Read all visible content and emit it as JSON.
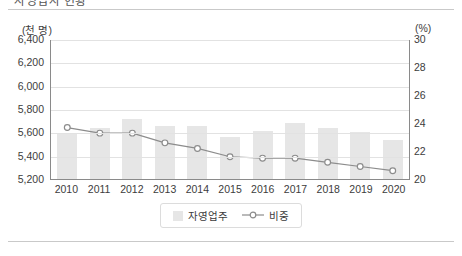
{
  "document": {
    "title_partial": "자영업자 현황",
    "has_top_rule": true,
    "has_bottom_rule": true
  },
  "chart_data": {
    "type": "bar",
    "title": "",
    "subtitle": "",
    "categories": [
      "2010",
      "2011",
      "2012",
      "2013",
      "2014",
      "2015",
      "2016",
      "2017",
      "2018",
      "2019",
      "2020"
    ],
    "series": [
      {
        "name": "자영업주",
        "type": "bar",
        "axis": "left",
        "unit": "천 명",
        "values": [
          5592,
          5640,
          5718,
          5656,
          5655,
          5562,
          5614,
          5682,
          5638,
          5606,
          5531
        ]
      },
      {
        "name": "비중",
        "type": "line",
        "axis": "right",
        "unit": "%",
        "values": [
          23.7,
          23.3,
          23.3,
          22.6,
          22.2,
          21.6,
          21.5,
          21.5,
          21.2,
          20.9,
          20.6
        ]
      }
    ],
    "xlabel": "",
    "ylabel_left": "(천 명)",
    "ylabel_right": "(%)",
    "ylim_left": [
      5200,
      6400
    ],
    "ylim_right": [
      20,
      30
    ],
    "yticks_left": [
      "6,400",
      "6,200",
      "6,000",
      "5,800",
      "5,600",
      "5,400",
      "5,200"
    ],
    "yticks_right": [
      "30",
      "28",
      "26",
      "24",
      "22",
      "20"
    ],
    "grid": true,
    "legend_position": "bottom-center",
    "colors": {
      "bar": "#e6e6e6",
      "line": "#8c8c8c",
      "marker_fill": "#ffffff",
      "axis": "#8a8a8a",
      "grid": "#e2e2e2",
      "text": "#3c3c3c"
    }
  },
  "legend": {
    "items": [
      {
        "label": "자영업주",
        "marker": "square-swatch"
      },
      {
        "label": "비중",
        "marker": "line-circle"
      }
    ]
  }
}
